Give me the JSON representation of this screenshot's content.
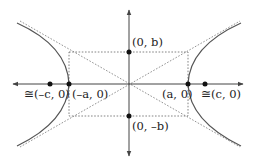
{
  "diagram": {
    "type": "hyperbola",
    "labels": {
      "pos_b": "(0, b)",
      "neg_b": "(0, –b)",
      "neg_a": "(–a, 0)",
      "pos_a": "(a, 0)",
      "neg_c": "≅(–c, 0)",
      "pos_c": "≅(c, 0)"
    },
    "colors": {
      "axis": "#444444",
      "curve": "#555555",
      "dashed": "#666666",
      "point": "#111111"
    }
  }
}
